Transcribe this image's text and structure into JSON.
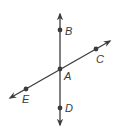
{
  "diagram": {
    "type": "intersecting-lines",
    "colors": {
      "line": "#3c3c3c",
      "point": "#3c3c3c",
      "label": "#3a3a3a",
      "background": "#ffffff"
    },
    "lines": [
      {
        "name": "line-BD",
        "points": [
          "B",
          "A",
          "D"
        ],
        "orientation": "vertical"
      },
      {
        "name": "line-EC",
        "points": [
          "E",
          "A",
          "C"
        ],
        "orientation": "oblique"
      }
    ],
    "points": {
      "A": {
        "label": "A"
      },
      "B": {
        "label": "B"
      },
      "C": {
        "label": "C"
      },
      "D": {
        "label": "D"
      },
      "E": {
        "label": "E"
      }
    }
  }
}
